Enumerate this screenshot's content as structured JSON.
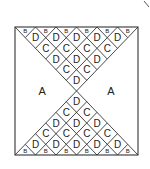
{
  "diagram": {
    "labels": {
      "A": "A",
      "B": "B",
      "C": "C",
      "D": "D"
    },
    "square": {
      "x": 15,
      "y": 27,
      "w": 123,
      "h": 128
    },
    "columns": 6,
    "stroke": "#333333",
    "regions": {
      "left": "A",
      "right": "A",
      "top_rows": [
        {
          "label": "B",
          "count": 6,
          "kind": "edge-triangle"
        },
        {
          "label": "D",
          "count": 5
        },
        {
          "label": "C",
          "count": 4
        },
        {
          "label": "D",
          "count": 3
        },
        {
          "label": "C",
          "count": 2
        },
        {
          "label": "D",
          "count": 1
        }
      ],
      "bottom_rows": [
        {
          "label": "D",
          "count": 1
        },
        {
          "label": "C",
          "count": 2
        },
        {
          "label": "D",
          "count": 3
        },
        {
          "label": "C",
          "count": 4
        },
        {
          "label": "D",
          "count": 5
        },
        {
          "label": "B",
          "count": 6,
          "kind": "edge-triangle"
        }
      ]
    }
  }
}
